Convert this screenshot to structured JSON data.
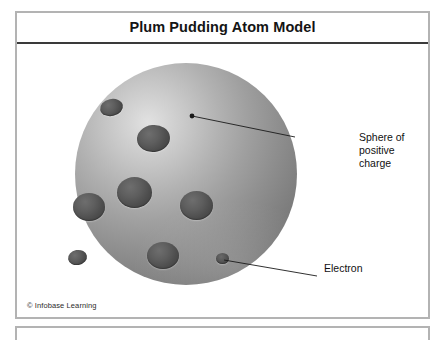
{
  "figure": {
    "title": "Plum Pudding Atom Model",
    "copyright": "© Infobase Learning"
  },
  "labels": {
    "sphere": "Sphere of\npositive\ncharge",
    "electron": "Electron"
  },
  "colors": {
    "frame_border": "#b3b3b3",
    "title_rule": "#3a3a3a",
    "title_text": "#141414",
    "label_text": "#111111",
    "sphere_highlight": "#e2e2e2",
    "sphere_midtone": "#a0a0a0",
    "sphere_shadow": "#6a6a6a",
    "electron_fill": "#4e4e4e",
    "leader_line": "#1a1a1a",
    "page_background": "#ffffff"
  },
  "diagram": {
    "type": "plum-pudding-atom-model",
    "sphere": {
      "cx": 169,
      "cy": 130,
      "r": 111
    },
    "electrons": [
      {
        "id": "electron-1",
        "cx": 94,
        "cy": 63,
        "rx": 11.5,
        "ry": 8.5,
        "tilt": -12
      },
      {
        "id": "electron-2",
        "cx": 136,
        "cy": 94,
        "rx": 16.5,
        "ry": 13.5,
        "tilt": -6
      },
      {
        "id": "electron-3",
        "cx": 117,
        "cy": 148,
        "rx": 17.5,
        "ry": 15.5,
        "tilt": 0
      },
      {
        "id": "electron-4",
        "cx": 72,
        "cy": 163,
        "rx": 16,
        "ry": 14,
        "tilt": 0
      },
      {
        "id": "electron-5",
        "cx": 179,
        "cy": 161,
        "rx": 16.5,
        "ry": 14.5,
        "tilt": 0
      },
      {
        "id": "electron-6",
        "cx": 60,
        "cy": 213,
        "rx": 9.5,
        "ry": 7.5,
        "tilt": -10
      },
      {
        "id": "electron-7",
        "cx": 146,
        "cy": 211,
        "rx": 16,
        "ry": 13.5,
        "tilt": 0
      },
      {
        "id": "electron-8",
        "cx": 205,
        "cy": 214,
        "rx": 6.5,
        "ry": 5.5,
        "tilt": 0
      }
    ],
    "leaders": [
      {
        "id": "leader-sphere",
        "x1": 175,
        "y1": 72,
        "x2": 278,
        "y2": 93
      },
      {
        "id": "leader-electron",
        "x1": 207,
        "y1": 216,
        "x2": 300,
        "y2": 232
      }
    ],
    "anchor_dot": {
      "cx": 175,
      "cy": 72,
      "r": 2.4
    }
  }
}
